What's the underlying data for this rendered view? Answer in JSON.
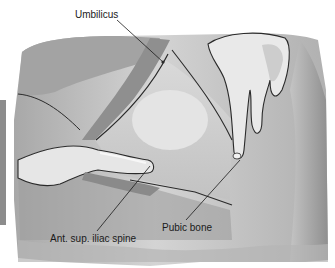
{
  "figure": {
    "palette": {
      "background": "#ffffff",
      "skin_light": "#e6e6e6",
      "skin_mid": "#c8c8c8",
      "skin_dark": "#9a9a9a",
      "shadow": "#7e7e7e",
      "outline": "#2a2a2a",
      "left_bar": "#8c8c8c"
    },
    "labels": [
      {
        "id": "umbilicus",
        "text": "Umbilicus"
      },
      {
        "id": "asis",
        "text": "Ant. sup. iliac spine"
      },
      {
        "id": "pubic_bone",
        "text": "Pubic bone"
      }
    ]
  }
}
